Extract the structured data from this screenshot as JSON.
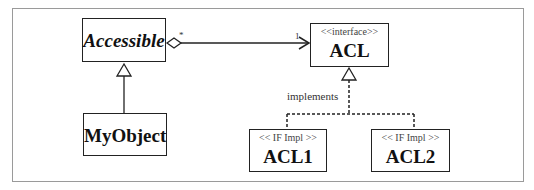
{
  "diagram": {
    "type": "uml-class-diagram",
    "classes": [
      {
        "id": "accessible",
        "name": "Accessible",
        "stereotype": "",
        "italic": true
      },
      {
        "id": "myobject",
        "name": "MyObject",
        "stereotype": ""
      },
      {
        "id": "acl",
        "name": "ACL",
        "stereotype": "<<interface>>"
      },
      {
        "id": "acl1",
        "name": "ACL1",
        "stereotype": "<< IF Impl >>"
      },
      {
        "id": "acl2",
        "name": "ACL2",
        "stereotype": "<< IF Impl >>"
      }
    ],
    "relationships": [
      {
        "type": "aggregation",
        "from": "Accessible",
        "to": "ACL",
        "from_multiplicity": "*",
        "to_multiplicity": "1"
      },
      {
        "type": "generalization",
        "from": "MyObject",
        "to": "Accessible"
      },
      {
        "type": "realization",
        "from": "ACL1",
        "to": "ACL",
        "label": "implements"
      },
      {
        "type": "realization",
        "from": "ACL2",
        "to": "ACL",
        "label": "implements"
      }
    ],
    "labels": {
      "implements": "implements",
      "mult_star": "*",
      "mult_one": "1"
    }
  }
}
